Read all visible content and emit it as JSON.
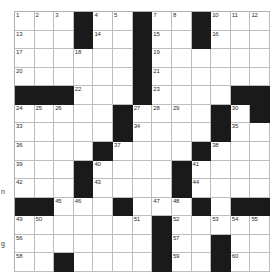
{
  "puzzle": {
    "title": "Crossword Grid",
    "rows": 14,
    "cols": 13,
    "block_color": "#1a1a1a",
    "cell_color": "#ffffff",
    "grid_line_color": "#bdbdbd",
    "blocks": [
      [
        0,
        3
      ],
      [
        0,
        6
      ],
      [
        0,
        9
      ],
      [
        1,
        3
      ],
      [
        1,
        6
      ],
      [
        1,
        9
      ],
      [
        2,
        6
      ],
      [
        3,
        6
      ],
      [
        4,
        0
      ],
      [
        4,
        1
      ],
      [
        4,
        2
      ],
      [
        4,
        6
      ],
      [
        4,
        11
      ],
      [
        4,
        12
      ],
      [
        5,
        5
      ],
      [
        5,
        10
      ],
      [
        5,
        12
      ],
      [
        6,
        5
      ],
      [
        6,
        10
      ],
      [
        7,
        4
      ],
      [
        7,
        9
      ],
      [
        8,
        3
      ],
      [
        8,
        8
      ],
      [
        9,
        3
      ],
      [
        9,
        8
      ],
      [
        10,
        0
      ],
      [
        10,
        1
      ],
      [
        10,
        5
      ],
      [
        10,
        9
      ],
      [
        10,
        11
      ],
      [
        10,
        12
      ],
      [
        11,
        7
      ],
      [
        12,
        7
      ],
      [
        12,
        10
      ],
      [
        13,
        2
      ],
      [
        13,
        7
      ],
      [
        13,
        10
      ]
    ],
    "numbers": [
      {
        "r": 0,
        "c": 0,
        "n": "1"
      },
      {
        "r": 0,
        "c": 1,
        "n": "2"
      },
      {
        "r": 0,
        "c": 2,
        "n": "3"
      },
      {
        "r": 0,
        "c": 4,
        "n": "4"
      },
      {
        "r": 0,
        "c": 5,
        "n": "5"
      },
      {
        "r": 0,
        "c": 6,
        "n": "6"
      },
      {
        "r": 0,
        "c": 7,
        "n": "7"
      },
      {
        "r": 0,
        "c": 8,
        "n": "8"
      },
      {
        "r": 0,
        "c": 9,
        "n": "9"
      },
      {
        "r": 0,
        "c": 10,
        "n": "10"
      },
      {
        "r": 0,
        "c": 11,
        "n": "11"
      },
      {
        "r": 0,
        "c": 12,
        "n": "12"
      },
      {
        "r": 1,
        "c": 0,
        "n": "13"
      },
      {
        "r": 1,
        "c": 4,
        "n": "14"
      },
      {
        "r": 1,
        "c": 7,
        "n": "15"
      },
      {
        "r": 1,
        "c": 10,
        "n": "16"
      },
      {
        "r": 2,
        "c": 0,
        "n": "17"
      },
      {
        "r": 2,
        "c": 3,
        "n": "18"
      },
      {
        "r": 2,
        "c": 7,
        "n": "19"
      },
      {
        "r": 3,
        "c": 0,
        "n": "20"
      },
      {
        "r": 3,
        "c": 7,
        "n": "21"
      },
      {
        "r": 4,
        "c": 3,
        "n": "22"
      },
      {
        "r": 4,
        "c": 7,
        "n": "23"
      },
      {
        "r": 5,
        "c": 0,
        "n": "24"
      },
      {
        "r": 5,
        "c": 1,
        "n": "25"
      },
      {
        "r": 5,
        "c": 2,
        "n": "26"
      },
      {
        "r": 5,
        "c": 6,
        "n": "27"
      },
      {
        "r": 5,
        "c": 7,
        "n": "28"
      },
      {
        "r": 5,
        "c": 8,
        "n": "29"
      },
      {
        "r": 5,
        "c": 11,
        "n": "30"
      },
      {
        "r": 5,
        "c": 12,
        "n": "31"
      },
      {
        "r": 6,
        "c": 0,
        "n": "33"
      },
      {
        "r": 6,
        "c": 6,
        "n": "34"
      },
      {
        "r": 6,
        "c": 11,
        "n": "35"
      },
      {
        "r": 7,
        "c": 0,
        "n": "36"
      },
      {
        "r": 7,
        "c": 5,
        "n": "37"
      },
      {
        "r": 7,
        "c": 10,
        "n": "38"
      },
      {
        "r": 8,
        "c": 0,
        "n": "39"
      },
      {
        "r": 8,
        "c": 4,
        "n": "40"
      },
      {
        "r": 8,
        "c": 9,
        "n": "41"
      },
      {
        "r": 9,
        "c": 0,
        "n": "42"
      },
      {
        "r": 9,
        "c": 4,
        "n": "43"
      },
      {
        "r": 9,
        "c": 9,
        "n": "44"
      },
      {
        "r": 10,
        "c": 2,
        "n": "45"
      },
      {
        "r": 10,
        "c": 3,
        "n": "46"
      },
      {
        "r": 10,
        "c": 7,
        "n": "47"
      },
      {
        "r": 10,
        "c": 8,
        "n": "48"
      },
      {
        "r": 11,
        "c": 0,
        "n": "49"
      },
      {
        "r": 11,
        "c": 1,
        "n": "50"
      },
      {
        "r": 11,
        "c": 6,
        "n": "51"
      },
      {
        "r": 11,
        "c": 8,
        "n": "52"
      },
      {
        "r": 11,
        "c": 10,
        "n": "53"
      },
      {
        "r": 11,
        "c": 11,
        "n": "54"
      },
      {
        "r": 11,
        "c": 12,
        "n": "55"
      },
      {
        "r": 12,
        "c": 0,
        "n": "56"
      },
      {
        "r": 12,
        "c": 8,
        "n": "57"
      },
      {
        "r": 13,
        "c": 0,
        "n": "58"
      },
      {
        "r": 13,
        "c": 8,
        "n": "59"
      },
      {
        "r": 13,
        "c": 11,
        "n": "60"
      }
    ]
  },
  "edge_labels": {
    "left_fragment_upper": "n",
    "left_fragment_lower": "g"
  }
}
